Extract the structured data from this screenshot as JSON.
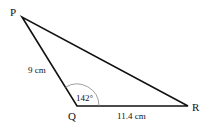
{
  "diagram": {
    "type": "triangle",
    "vertices": [
      {
        "label": "P",
        "x": 22,
        "y": 17
      },
      {
        "label": "Q",
        "x": 77,
        "y": 106
      },
      {
        "label": "R",
        "x": 188,
        "y": 106
      }
    ],
    "sides": [
      {
        "from": "P",
        "to": "Q",
        "length_label": "9 cm"
      },
      {
        "from": "Q",
        "to": "R",
        "length_label": "11.4 cm"
      },
      {
        "from": "P",
        "to": "R",
        "length_label": ""
      }
    ],
    "angle": {
      "vertex": "Q",
      "label": "142°"
    },
    "line_color": "#111111",
    "arc_color": "#888888"
  }
}
